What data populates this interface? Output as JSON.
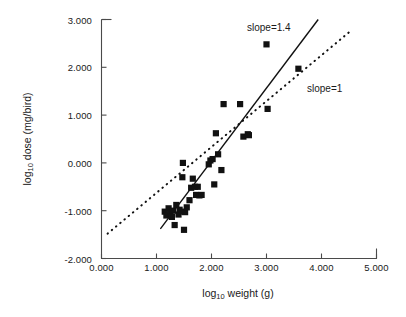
{
  "chart_data": {
    "type": "scatter",
    "title": "",
    "xlabel": "log10 weight (g)",
    "ylabel": "log10 dose (mg/bird)",
    "xlim": [
      0.0,
      5.0
    ],
    "ylim": [
      -2.0,
      3.0
    ],
    "xticks": [
      "0.000",
      "1.000",
      "2.000",
      "3.000",
      "4.000",
      "5.000"
    ],
    "yticks": [
      "-2.000",
      "-1.000",
      "0.000",
      "1.000",
      "2.000",
      "3.000"
    ],
    "xtick_values": [
      0,
      1,
      2,
      3,
      4,
      5
    ],
    "ytick_values": [
      -2,
      -1,
      0,
      1,
      2,
      3
    ],
    "grid": false,
    "legend": "none",
    "points": [
      [
        1.15,
        -1.02
      ],
      [
        1.18,
        -1.1
      ],
      [
        1.22,
        -0.95
      ],
      [
        1.25,
        -1.05
      ],
      [
        1.28,
        -1.13
      ],
      [
        1.3,
        -1.0
      ],
      [
        1.33,
        -1.3
      ],
      [
        1.36,
        -0.88
      ],
      [
        1.4,
        -1.08
      ],
      [
        1.42,
        -0.98
      ],
      [
        1.45,
        -1.02
      ],
      [
        1.47,
        -0.3
      ],
      [
        1.48,
        0.0
      ],
      [
        1.5,
        -1.4
      ],
      [
        1.52,
        -1.03
      ],
      [
        1.55,
        -0.93
      ],
      [
        1.6,
        -0.78
      ],
      [
        1.63,
        -0.52
      ],
      [
        1.66,
        -0.33
      ],
      [
        1.7,
        -0.5
      ],
      [
        1.72,
        -0.67
      ],
      [
        1.75,
        -0.5
      ],
      [
        1.78,
        -0.68
      ],
      [
        1.82,
        -0.67
      ],
      [
        1.95,
        -0.03
      ],
      [
        1.98,
        0.05
      ],
      [
        2.02,
        0.08
      ],
      [
        2.05,
        -0.45
      ],
      [
        2.08,
        0.62
      ],
      [
        2.12,
        0.18
      ],
      [
        2.18,
        -0.15
      ],
      [
        2.22,
        1.23
      ],
      [
        2.52,
        1.23
      ],
      [
        2.58,
        0.55
      ],
      [
        2.66,
        0.6
      ],
      [
        2.68,
        0.58
      ],
      [
        3.0,
        2.48
      ],
      [
        3.02,
        1.13
      ],
      [
        3.58,
        1.97
      ]
    ],
    "marker": "filled-square",
    "marker_color": "#111111",
    "lines": [
      {
        "name": "slope-1.4-line",
        "label": "slope=1.4",
        "style": "solid",
        "slope": 1.4,
        "x_start": 1.07,
        "y_start": -1.38,
        "x_end": 3.94,
        "y_end": 3.0
      },
      {
        "name": "slope-1-line",
        "label": "slope=1",
        "style": "dotted",
        "slope": 1.0,
        "x_start": 0.11,
        "y_start": -1.48,
        "x_end": 4.56,
        "y_end": 2.79
      }
    ]
  },
  "axis": {
    "x_title_prefix": "log",
    "x_title_sub": "10",
    "x_title_suffix": " weight (g)",
    "y_title_prefix": "log",
    "y_title_sub": "10",
    "y_title_suffix": " dose (mg/bird)"
  },
  "annotations": {
    "slope_high": "slope=1.4",
    "slope_low": "slope=1"
  },
  "colors": {
    "axis": "#4a4a4a",
    "marker": "#111111",
    "line_solid": "#111111",
    "line_dotted": "#111111",
    "background": "#ffffff"
  }
}
